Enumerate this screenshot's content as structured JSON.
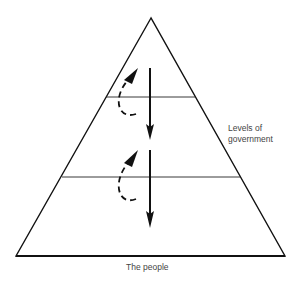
{
  "diagram": {
    "type": "pyramid",
    "levels": 3,
    "labels": {
      "side": "Levels of government",
      "side_line1": "Levels of",
      "side_line2": "government",
      "base": "The people"
    },
    "arrows": [
      {
        "style": "solid",
        "direction": "down",
        "from": "level-1",
        "to": "level-2"
      },
      {
        "style": "dashed",
        "direction": "up",
        "from": "level-2",
        "to": "level-1"
      },
      {
        "style": "solid",
        "direction": "down",
        "from": "level-2",
        "to": "level-3"
      },
      {
        "style": "dashed",
        "direction": "up",
        "from": "level-3",
        "to": "level-2"
      }
    ],
    "colors": {
      "stroke": "#111111",
      "text": "#444444",
      "background": "#ffffff"
    }
  }
}
